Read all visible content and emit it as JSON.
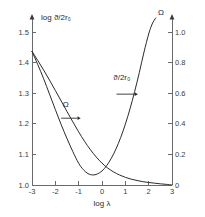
{
  "chart_data": {
    "type": "line",
    "title": "",
    "subtitle": "",
    "xlabel": "log λ",
    "ylabel": "log ϑ/2r₀",
    "ylabel_right": "Ω",
    "xlim": [
      -3,
      3
    ],
    "ylim": [
      1.0,
      1.5
    ],
    "ylim_right": [
      0.0,
      1.0
    ],
    "grid": false,
    "legend_position": "inline-annotations",
    "x_ticks": [
      "-3",
      "-2",
      "-1",
      "0",
      "1",
      "2",
      "3"
    ],
    "x_tick_values": [
      -3,
      -2,
      -1,
      0,
      1,
      2,
      3
    ],
    "y_ticks": [
      "1.0",
      "1.1",
      "1.2",
      "1.3",
      "1.4",
      "1.5"
    ],
    "y_tick_values": [
      1.0,
      1.1,
      1.2,
      1.3,
      1.4,
      1.5
    ],
    "y_right_ticks": [
      "0",
      "0.2",
      "0.4",
      "0.6",
      "0.8",
      "1.0"
    ],
    "y_right_tick_values": [
      0.0,
      0.2,
      0.4,
      0.6,
      0.8,
      1.0
    ],
    "series": [
      {
        "name": "ϑ/2r₀",
        "axis": "left",
        "x": [
          -3.0,
          -2.75,
          -2.5,
          -2.25,
          -2.0,
          -1.75,
          -1.5,
          -1.25,
          -1.0,
          -0.8,
          -0.6,
          -0.4,
          -0.2,
          0.0,
          0.2,
          0.4,
          0.6,
          0.8,
          1.0,
          1.2,
          1.4,
          1.6,
          1.8,
          2.0,
          2.15,
          2.3
        ],
        "values": [
          1.4,
          1.36,
          1.318,
          1.272,
          1.226,
          1.181,
          1.139,
          1.1,
          1.065,
          1.046,
          1.034,
          1.03,
          1.033,
          1.042,
          1.058,
          1.08,
          1.108,
          1.142,
          1.182,
          1.228,
          1.28,
          1.337,
          1.398,
          1.452,
          1.482,
          1.5
        ]
      },
      {
        "name": "Ω",
        "axis": "right",
        "x": [
          -3.0,
          -2.75,
          -2.5,
          -2.25,
          -2.0,
          -1.75,
          -1.5,
          -1.25,
          -1.0,
          -0.75,
          -0.5,
          -0.25,
          0.0,
          0.25,
          0.5,
          0.75,
          1.0,
          1.25,
          1.5,
          1.75,
          2.0,
          2.25,
          2.5,
          2.75,
          3.0
        ],
        "values": [
          0.8,
          0.745,
          0.688,
          0.628,
          0.566,
          0.503,
          0.44,
          0.378,
          0.318,
          0.262,
          0.212,
          0.168,
          0.131,
          0.101,
          0.078,
          0.06,
          0.046,
          0.035,
          0.027,
          0.02,
          0.015,
          0.011,
          0.007,
          0.004,
          0.0
        ]
      }
    ],
    "annotations": [
      {
        "label": "Ω",
        "label_x": -1.55,
        "label_y_right": 0.47,
        "arrow_from_x": -1.75,
        "arrow_to_x": -1.05,
        "arrow_y_right": 0.4,
        "direction": "right"
      },
      {
        "label": "ϑ/2r₀",
        "label_x": 0.85,
        "label_y_left": 1.315,
        "arrow_from_x": 0.62,
        "arrow_to_x": 1.4,
        "arrow_y_left": 1.272,
        "direction": "right"
      }
    ],
    "colors": {
      "curve": "#2b2b2b",
      "axis": "#6a6a6a",
      "text": "#3c3c3c",
      "background": "#ffffff"
    }
  }
}
